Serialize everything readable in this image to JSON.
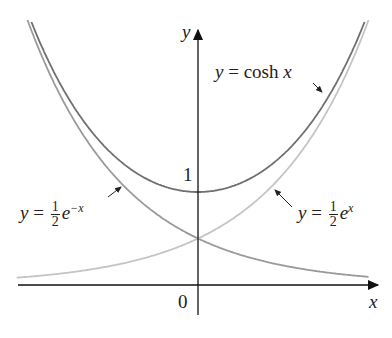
{
  "chart_data": {
    "type": "line",
    "title": "",
    "xlabel": "x",
    "ylabel": "y",
    "tick_labels": {
      "origin": "0",
      "y_tick": "1"
    },
    "xlim": [
      -2.0,
      1.85
    ],
    "ylim": [
      -0.3,
      2.8
    ],
    "grid": false,
    "legend": "none (inline annotations with arrows)",
    "series": [
      {
        "name": "y = cosh x",
        "function": "cosh(x)",
        "color": "#707070",
        "x": [
          -1.7,
          -1.2,
          -0.8,
          -0.4,
          0,
          0.4,
          0.8,
          1.2,
          1.7
        ],
        "values": [
          2.83,
          1.81,
          1.34,
          1.08,
          1.0,
          1.08,
          1.34,
          1.81,
          2.83
        ]
      },
      {
        "name": "y = 1/2 e^{-x}",
        "function": "0.5*exp(-x)",
        "color": "#9a9a9a",
        "x": [
          -1.7,
          -1.2,
          -0.8,
          -0.4,
          0,
          0.4,
          0.8,
          1.2,
          1.7
        ],
        "values": [
          2.74,
          1.66,
          1.11,
          0.75,
          0.5,
          0.34,
          0.22,
          0.15,
          0.09
        ]
      },
      {
        "name": "y = 1/2 e^{x}",
        "function": "0.5*exp(x)",
        "color": "#c4c4c4",
        "x": [
          -1.7,
          -1.2,
          -0.8,
          -0.4,
          0,
          0.4,
          0.8,
          1.2,
          1.7
        ],
        "values": [
          0.09,
          0.15,
          0.22,
          0.34,
          0.5,
          0.75,
          1.11,
          1.66,
          2.74
        ]
      }
    ],
    "annotations": [
      {
        "text": "y = cosh x",
        "arrow_to": "cosh curve, upper right"
      },
      {
        "text": "y = 1/2 e^{-x}",
        "arrow_to": "decreasing exponential, left"
      },
      {
        "text": "y = 1/2 e^{x}",
        "arrow_to": "increasing exponential, right"
      }
    ]
  },
  "labels": {
    "y_axis": "y",
    "x_axis": "x",
    "origin": "0",
    "one": "1",
    "cosh": {
      "prefix": "y = cosh ",
      "var": "x"
    },
    "left": {
      "prefix": "y = ",
      "num": "1",
      "den": "2",
      "base": "e",
      "exp": "−x"
    },
    "right": {
      "prefix": "y = ",
      "num": "1",
      "den": "2",
      "base": "e",
      "exp": "x"
    }
  }
}
